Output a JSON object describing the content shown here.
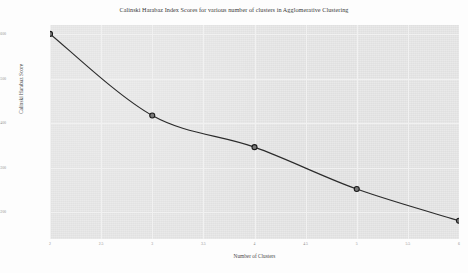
{
  "chart_data": {
    "type": "line",
    "title": "Calinski Harabaz Index Scores for various number of clusters in Agglomerative Clustering",
    "xlabel": "Number of Clusters",
    "ylabel": "Calinski Harabaz Score",
    "x": [
      2,
      3,
      4,
      5,
      6
    ],
    "values": [
      1600,
      1417,
      1346,
      1252,
      1181
    ],
    "series": [
      {
        "name": "Calinski Harabaz Score",
        "values": [
          1600,
          1417,
          1346,
          1252,
          1181
        ]
      }
    ],
    "xlim": [
      2,
      6
    ],
    "ylim": [
      1140,
      1620
    ],
    "xticks": [
      "2",
      "2.5",
      "3",
      "3.5",
      "4",
      "4.5",
      "5",
      "5.5",
      "6"
    ],
    "xtick_values": [
      2,
      2.5,
      3,
      3.5,
      4,
      4.5,
      5,
      5.5,
      6
    ],
    "yticks": [
      "1600",
      "1500",
      "1400",
      "1300",
      "1200"
    ],
    "ytick_values": [
      1600,
      1500,
      1400,
      1300,
      1200
    ],
    "grid": true,
    "legend": null,
    "marker": "circle",
    "line_color": "#2b2b2b",
    "marker_facecolor": "#7a7a7a",
    "marker_edgecolor": "#1a1a1a",
    "plot_background": "#e3e3e3",
    "figure_background": "#fdfdfd",
    "grid_color": "#f1f1f1",
    "points": [
      {
        "x": 2,
        "y": 1600
      },
      {
        "x": 3,
        "y": 1417
      },
      {
        "x": 4,
        "y": 1346
      },
      {
        "x": 5,
        "y": 1252
      },
      {
        "x": 6,
        "y": 1181
      }
    ]
  }
}
